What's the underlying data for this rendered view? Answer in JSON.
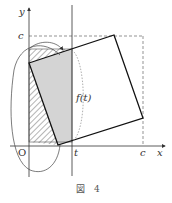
{
  "figure": {
    "caption": "図　4",
    "labels": {
      "y_axis": "y",
      "x_axis": "x",
      "origin": "O",
      "c_on_y": "c",
      "c_on_x": "c",
      "t_on_x": "t",
      "function": "f(t)"
    },
    "colors": {
      "stroke": "#222222",
      "gray_fill": "#d4d4d4",
      "hatch": "#444444",
      "dashed": "#666666"
    }
  }
}
